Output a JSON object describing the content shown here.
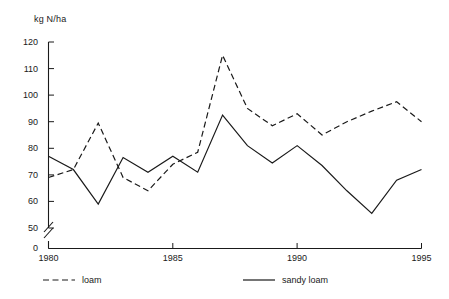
{
  "chart_data": {
    "type": "line",
    "title": "",
    "subtitle": "",
    "xlabel": "",
    "ylabel": "kg N/ha",
    "x": [
      1980,
      1981,
      1982,
      1983,
      1984,
      1985,
      1986,
      1987,
      1988,
      1989,
      1990,
      1991,
      1992,
      1993,
      1994,
      1995
    ],
    "series": [
      {
        "name": "loam",
        "style": "dashed",
        "values": [
          69,
          72,
          89.5,
          69,
          64,
          74,
          78.5,
          115,
          95,
          88.5,
          93,
          85,
          90,
          94,
          97.5,
          90
        ]
      },
      {
        "name": "sandy loam",
        "style": "solid",
        "values": [
          77,
          72,
          59,
          76.5,
          71,
          77,
          71,
          92.5,
          81,
          74.5,
          81,
          73.5,
          64,
          55.5,
          68,
          72
        ]
      }
    ],
    "xlim": [
      1980,
      1995
    ],
    "ylim": [
      50,
      120
    ],
    "y_axis_has_break": true,
    "y_zero_label": "0",
    "y_ticks": [
      50,
      60,
      70,
      80,
      90,
      100,
      110,
      120
    ],
    "y_tick_labels": [
      "50",
      "60",
      "70",
      "80",
      "90",
      "100",
      "110",
      "120"
    ],
    "x_ticks": [
      1980,
      1985,
      1990,
      1995
    ],
    "x_tick_labels": [
      "1980",
      "1985",
      "1990",
      "1995"
    ],
    "grid": false,
    "legend_position": "bottom",
    "line_color": "#1a1a1a",
    "background_color": "#ffffff"
  },
  "axis": {
    "unit_label": "kg N/ha",
    "zero_label": "0"
  },
  "legend": {
    "entries": [
      {
        "label": "loam",
        "style": "dashed"
      },
      {
        "label": "sandy loam",
        "style": "solid"
      }
    ]
  }
}
